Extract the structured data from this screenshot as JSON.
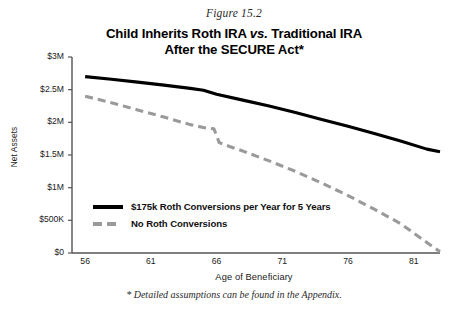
{
  "figure": {
    "number_label": "Figure 15.2",
    "title_line_1_pre": "Child Inherits Roth IRA ",
    "title_line_1_vs": "vs.",
    "title_line_1_post": " Traditional IRA",
    "title_line_2": "After the SECURE Act*",
    "footnote": "* Detailed assumptions can be found in the Appendix."
  },
  "chart_data": {
    "type": "line",
    "title": "Child Inherits Roth IRA vs. Traditional IRA After the SECURE Act*",
    "subtitle": "Figure 15.2",
    "xlabel": "Age of Beneficiary",
    "ylabel": "Net Assets",
    "xlim": [
      55,
      83
    ],
    "ylim": [
      0,
      3000000
    ],
    "xticks": [
      56,
      61,
      66,
      71,
      76,
      81
    ],
    "xtick_labels": [
      "56",
      "61",
      "66",
      "71",
      "76",
      "81"
    ],
    "yticks": [
      0,
      500000,
      1000000,
      1500000,
      2000000,
      2500000,
      3000000
    ],
    "ytick_labels": [
      "$0",
      "$500K",
      "$1M",
      "$1.5M",
      "$2M",
      "$2.5M",
      "$3M"
    ],
    "grid": false,
    "legend_position": "inside-lower-left",
    "series": [
      {
        "name": "$175k Roth Conversions per Year for 5 Years",
        "style": "solid",
        "color": "#000000",
        "x": [
          56,
          58,
          60,
          62,
          64,
          65,
          66,
          68,
          70,
          72,
          74,
          76,
          78,
          80,
          82,
          83
        ],
        "values": [
          2700000,
          2660000,
          2615000,
          2570000,
          2520000,
          2490000,
          2430000,
          2340000,
          2250000,
          2150000,
          2045000,
          1940000,
          1830000,
          1715000,
          1590000,
          1550000
        ]
      },
      {
        "name": "No Roth Conversions",
        "style": "dashed",
        "color": "#9a9a9a",
        "x": [
          56,
          58,
          60,
          62,
          64,
          65,
          65.8,
          66.2,
          67,
          68,
          70,
          72,
          74,
          76,
          78,
          80,
          82,
          83
        ],
        "values": [
          2400000,
          2300000,
          2190000,
          2080000,
          1965000,
          1920000,
          1900000,
          1690000,
          1630000,
          1560000,
          1410000,
          1250000,
          1070000,
          880000,
          670000,
          450000,
          160000,
          20000
        ]
      }
    ]
  },
  "legend": {
    "items": [
      {
        "label": "$175k Roth Conversions per Year for 5 Years",
        "style": "solid"
      },
      {
        "label": "No Roth Conversions",
        "style": "dashed"
      }
    ]
  }
}
